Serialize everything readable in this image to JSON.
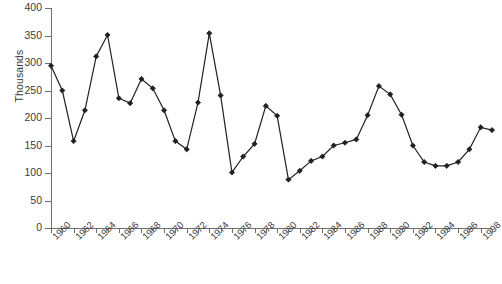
{
  "chart_data": {
    "type": "line",
    "title": "",
    "subtitle": "",
    "xlabel": "",
    "ylabel": "Thousands",
    "ylim": [
      0,
      400
    ],
    "xlim": [
      1960,
      1999
    ],
    "ytick_step": 50,
    "yticks": [
      400,
      350,
      300,
      250,
      200,
      150,
      100,
      50,
      0
    ],
    "ytick_labels": [
      "400",
      "350",
      "300",
      "250",
      "200",
      "150",
      "100",
      "50",
      "0"
    ],
    "xticks": [
      1960,
      1961,
      1962,
      1963,
      1964,
      1965,
      1966,
      1967,
      1968,
      1969,
      1970,
      1971,
      1972,
      1973,
      1974,
      1975,
      1976,
      1977,
      1978,
      1979,
      1980,
      1981,
      1982,
      1983,
      1984,
      1985,
      1986,
      1987,
      1988,
      1989,
      1990,
      1991,
      1992,
      1993,
      1994,
      1995,
      1996,
      1997,
      1998,
      1999
    ],
    "xtick_labels": [
      "1960",
      "",
      "1962",
      "",
      "1964",
      "",
      "1966",
      "",
      "1968",
      "",
      "1970",
      "",
      "1972",
      "",
      "1974",
      "",
      "1976",
      "",
      "1978",
      "",
      "1980",
      "",
      "1982",
      "",
      "1984",
      "",
      "1986",
      "",
      "1988",
      "",
      "1990",
      "",
      "1992",
      "",
      "1994",
      "",
      "1996",
      "",
      "1998",
      ""
    ],
    "grid": false,
    "legend": false,
    "legend_position": "none",
    "marker": "diamond",
    "line_color": "#231f20",
    "marker_color": "#231f20",
    "x": [
      1960,
      1961,
      1962,
      1963,
      1964,
      1965,
      1966,
      1967,
      1968,
      1969,
      1970,
      1971,
      1972,
      1973,
      1974,
      1975,
      1976,
      1977,
      1978,
      1979,
      1980,
      1981,
      1982,
      1983,
      1984,
      1985,
      1986,
      1987,
      1988,
      1989,
      1990,
      1991,
      1992,
      1993,
      1994,
      1995,
      1996,
      1997,
      1998,
      1999
    ],
    "values": [
      295,
      250,
      158,
      214,
      312,
      351,
      236,
      227,
      271,
      254,
      214,
      158,
      143,
      228,
      354,
      241,
      101,
      130,
      153,
      222,
      204,
      88,
      104,
      122,
      130,
      150,
      155,
      161,
      205,
      258,
      243,
      206,
      150,
      120,
      113,
      113,
      120,
      143,
      183,
      178
    ],
    "series": [
      {
        "name": "value",
        "values": [
          295,
          250,
          158,
          214,
          312,
          351,
          236,
          227,
          271,
          254,
          214,
          158,
          143,
          228,
          354,
          241,
          101,
          130,
          153,
          222,
          204,
          88,
          104,
          122,
          130,
          150,
          155,
          161,
          205,
          258,
          243,
          206,
          150,
          120,
          113,
          113,
          120,
          143,
          183,
          178
        ]
      }
    ]
  },
  "figure": {
    "caption": ""
  }
}
